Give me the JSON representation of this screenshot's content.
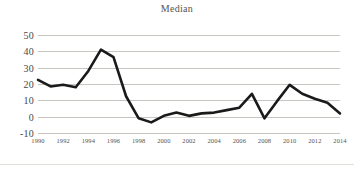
{
  "chart_data": {
    "type": "line",
    "title": "Median",
    "xlabel": "",
    "ylabel": "",
    "ylim": [
      -10,
      50
    ],
    "yticks": [
      50,
      40,
      30,
      20,
      10,
      0,
      -10
    ],
    "grid": true,
    "legend": false,
    "x": [
      1990,
      1991,
      1992,
      1993,
      1994,
      1995,
      1996,
      1997,
      1998,
      1999,
      2000,
      2001,
      2002,
      2003,
      2004,
      2005,
      2006,
      2007,
      2008,
      2009,
      2010,
      2011,
      2012,
      2013,
      2014
    ],
    "xtick_labels": [
      "1990",
      "1992",
      "1994",
      "1996",
      "1998",
      "2000",
      "2002",
      "2004",
      "2006",
      "2008",
      "2010",
      "2012",
      "2014"
    ],
    "xticks": [
      1990,
      1992,
      1994,
      1996,
      1998,
      2000,
      2002,
      2004,
      2006,
      2008,
      2010,
      2012,
      2014
    ],
    "series": [
      {
        "name": "Median",
        "color": "#1a1a1a",
        "values": [
          22.5,
          18.5,
          19.5,
          18.0,
          28.0,
          41.0,
          36.5,
          12.5,
          -1.0,
          -3.5,
          0.5,
          2.5,
          0.5,
          2.0,
          2.5,
          4.0,
          5.5,
          14.0,
          -1.0,
          9.5,
          19.5,
          14.0,
          11.0,
          8.5,
          2.0
        ]
      }
    ]
  }
}
